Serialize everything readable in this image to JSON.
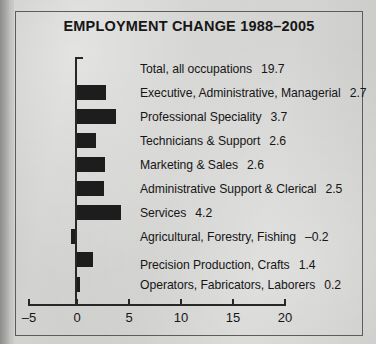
{
  "figure": {
    "title": "EMPLOYMENT CHANGE 1988–2005",
    "frame_color": "#5c5c5a",
    "bar_color": "#1d1d1d",
    "paper_color": "#cdcdcb"
  },
  "chart_data": {
    "type": "bar",
    "orientation": "horizontal",
    "title": "EMPLOYMENT CHANGE 1988–2005",
    "xlabel": "",
    "ylabel": "",
    "xlim": [
      -5,
      20
    ],
    "xticks": [
      -5,
      0,
      5,
      10,
      15,
      20
    ],
    "xticklabels": [
      "–5",
      "0",
      "5",
      "10",
      "15",
      "20"
    ],
    "grid": false,
    "legend": null,
    "categories": [
      "Total, all occupations",
      "Executive, Administrative, Managerial",
      "Professional Speciality",
      "Technicians & Support",
      "Marketing & Sales",
      "Administrative Support & Clerical",
      "Services",
      "Agricultural, Forestry, Fishing",
      "Precision Production, Crafts",
      "Operators, Fabricators, Laborers"
    ],
    "values": [
      19.7,
      2.7,
      3.7,
      2.6,
      2.6,
      2.5,
      4.2,
      -0.2,
      1.4,
      0.2
    ],
    "value_labels": [
      "19.7",
      "2.7",
      "3.7",
      "2.6",
      "2.6",
      "2.5",
      "4.2",
      "–0.2",
      "1.4",
      "0.2"
    ],
    "bar_drawn": [
      false,
      true,
      true,
      true,
      true,
      true,
      true,
      true,
      true,
      true
    ]
  },
  "rows": [
    {
      "label": "Total, all occupations",
      "value": "19.7",
      "bar_w": 0,
      "bar_x": 0,
      "top": 62,
      "bar_top": 0,
      "draw": false
    },
    {
      "label": "Executive, Administrative, Managerial",
      "value": "2.7",
      "bar_w": 29,
      "bar_x": 77,
      "top": 86,
      "bar_top": 85,
      "draw": true
    },
    {
      "label": "Professional Speciality",
      "value": "3.7",
      "bar_w": 39,
      "bar_x": 77,
      "top": 110,
      "bar_top": 109,
      "draw": true
    },
    {
      "label": "Technicians & Support",
      "value": "2.6",
      "bar_w": 19,
      "bar_x": 77,
      "top": 134,
      "bar_top": 133,
      "draw": true
    },
    {
      "label": "Marketing & Sales",
      "value": "2.6",
      "bar_w": 28,
      "bar_x": 77,
      "top": 158,
      "bar_top": 157,
      "draw": true
    },
    {
      "label": "Administrative Support & Clerical",
      "value": "2.5",
      "bar_w": 27,
      "bar_x": 77,
      "top": 182,
      "bar_top": 181,
      "draw": true
    },
    {
      "label": "Services",
      "value": "4.2",
      "bar_w": 44,
      "bar_x": 77,
      "top": 206,
      "bar_top": 205,
      "draw": true
    },
    {
      "label": "Agricultural, Forestry, Fishing",
      "value": "–0.2",
      "bar_w": 4,
      "bar_x": 71,
      "top": 230,
      "bar_top": 229,
      "draw": true
    },
    {
      "label": "Precision Production, Crafts",
      "value": "1.4",
      "bar_w": 16,
      "bar_x": 77,
      "top": 258,
      "bar_top": 252,
      "draw": true
    },
    {
      "label": "Operators, Fabricators, Laborers",
      "value": "0.2",
      "bar_w": 3,
      "bar_x": 77,
      "top": 278,
      "bar_top": 277,
      "draw": true
    }
  ],
  "axis": {
    "ticks": [
      {
        "label": "–5",
        "x": 28
      },
      {
        "label": "0",
        "x": 76
      },
      {
        "label": "5",
        "x": 128
      },
      {
        "label": "10",
        "x": 180
      },
      {
        "label": "15",
        "x": 232
      },
      {
        "label": "20",
        "x": 284
      }
    ]
  }
}
